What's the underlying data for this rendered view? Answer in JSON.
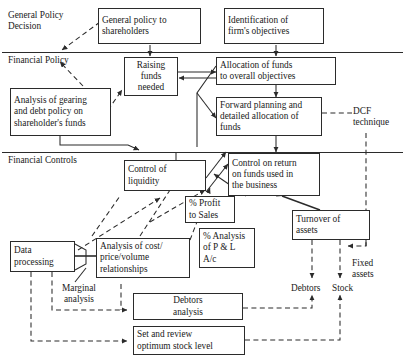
{
  "diagram": {
    "type": "flowchart",
    "bands": [
      {
        "id": "general-policy-decision",
        "label": "General Policy\nDecision"
      },
      {
        "id": "financial-policy",
        "label": "Financial Policy"
      },
      {
        "id": "financial-controls",
        "label": "Financial Controls"
      }
    ],
    "boxes": [
      {
        "id": "general-policy-to-shareholders",
        "label": "General policy to\nshareholders"
      },
      {
        "id": "identification-of-firms-objectives",
        "label": "Identification of\nfirm's objectives"
      },
      {
        "id": "raising-funds-needed",
        "label": "Raising\nfunds\nneeded"
      },
      {
        "id": "allocation-of-funds",
        "label": "Allocation of funds\nto overall objectives"
      },
      {
        "id": "analysis-of-gearing",
        "label": "Analysis of gearing\nand debt policy on\nshareholder's funds"
      },
      {
        "id": "forward-planning",
        "label": "Forward planning and\ndetailed allocation of\nfunds"
      },
      {
        "id": "control-of-liquidity",
        "label": "Control of\nliquidity"
      },
      {
        "id": "control-on-return",
        "label": "Control on return\non funds used in\nthe business"
      },
      {
        "id": "percent-profit-to-sales",
        "label": "% Profit\nto Sales"
      },
      {
        "id": "percent-analysis-p-and-l",
        "label": "% Analysis\nof P & L\nA/c"
      },
      {
        "id": "turnover-of-assets",
        "label": "Turnover of\nassets"
      },
      {
        "id": "data-processing",
        "label": "Data\nprocessing"
      },
      {
        "id": "analysis-of-cost-price-volume",
        "label": "Analysis of cost/\nprice/volume\nrelationships"
      },
      {
        "id": "debtors-analysis",
        "label": "Debtors\nanalysis"
      },
      {
        "id": "set-and-review-optimum-stock-level",
        "label": "Set and review\noptimum stock level"
      }
    ],
    "free_labels": [
      {
        "id": "dcf-technique",
        "label": "DCF\ntechnique"
      },
      {
        "id": "marginal-analysis",
        "label": "Marginal\nanalysis"
      },
      {
        "id": "fixed-assets",
        "label": "Fixed\nassets"
      },
      {
        "id": "debtors",
        "label": "Debtors"
      },
      {
        "id": "stock",
        "label": "Stock"
      }
    ],
    "colors": {
      "stroke": "#2b2b2b",
      "background": "#ffffff",
      "text": "#1a1a1a"
    }
  }
}
